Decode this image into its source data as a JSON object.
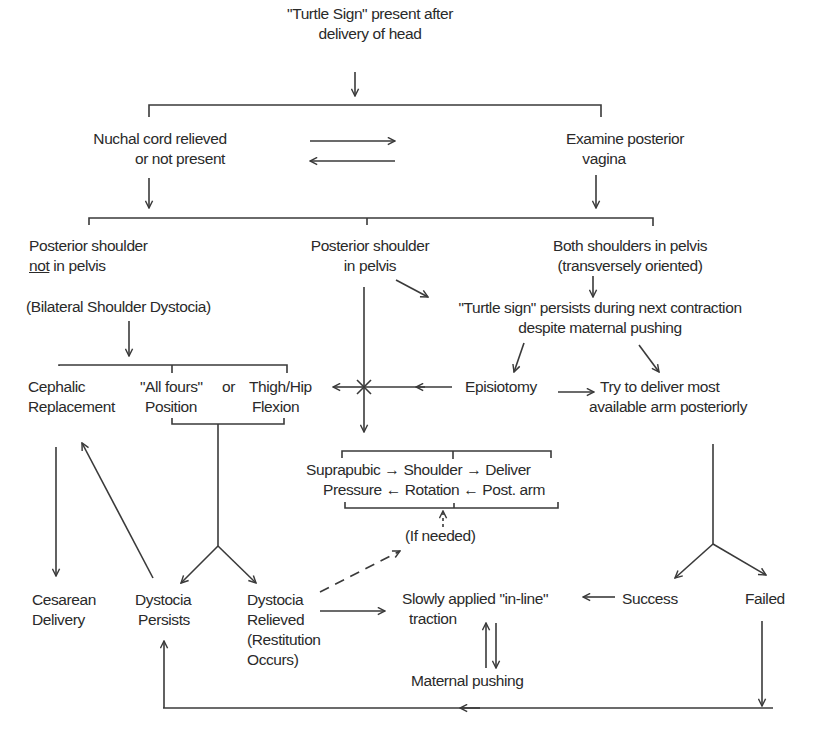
{
  "diagram": {
    "type": "flowchart",
    "nodes": {
      "start": {
        "lines": [
          "\"Turtle Sign\" present after",
          "delivery of head"
        ]
      },
      "nuchal": {
        "lines": [
          "Nuchal cord relieved",
          "or not present"
        ]
      },
      "examine": {
        "lines": [
          "Examine posterior",
          "vagina"
        ]
      },
      "post_not": {
        "line1": "Posterior shoulder",
        "line2_underlined": "not",
        "line2_rest": " in pelvis"
      },
      "post_in": {
        "lines": [
          "Posterior shoulder",
          "in pelvis"
        ]
      },
      "both": {
        "lines": [
          "Both shoulders in pelvis",
          "(transversely oriented)"
        ]
      },
      "bilateral": {
        "lines": [
          "(Bilateral Shoulder Dystocia)"
        ]
      },
      "turtle_persists": {
        "lines": [
          "\"Turtle sign\" persists during next contraction",
          "despite maternal pushing"
        ]
      },
      "cephalic": {
        "lines": [
          "Cephalic",
          "Replacement"
        ]
      },
      "allfours": {
        "lines": [
          "\"All fours\"",
          "Position"
        ]
      },
      "or": {
        "lines": [
          "or"
        ]
      },
      "thigh": {
        "lines": [
          "Thigh/Hip",
          "Flexion"
        ]
      },
      "episiotomy": {
        "lines": [
          "Episiotomy"
        ]
      },
      "try_deliver": {
        "lines": [
          "Try to deliver most",
          "available arm posteriorly"
        ]
      },
      "suprapubic": {
        "lines": [
          "Suprapubic",
          "Pressure"
        ]
      },
      "shoulder_rot": {
        "lines": [
          "Shoulder",
          "Rotation"
        ]
      },
      "deliver_post": {
        "lines": [
          "Deliver",
          "Post. arm"
        ]
      },
      "if_needed": {
        "lines": [
          "(If needed)"
        ]
      },
      "cesarean": {
        "lines": [
          "Cesarean",
          "Delivery"
        ]
      },
      "persists": {
        "lines": [
          "Dystocia",
          "Persists"
        ]
      },
      "relieved": {
        "lines": [
          "Dystocia",
          "Relieved",
          "(Restitution",
          "Occurs)"
        ]
      },
      "traction": {
        "lines": [
          "Slowly applied \"in-line\"",
          "traction"
        ]
      },
      "success": {
        "lines": [
          "Success"
        ]
      },
      "failed": {
        "lines": [
          "Failed"
        ]
      },
      "maternal": {
        "lines": [
          "Maternal pushing"
        ]
      }
    },
    "inline_arrows": {
      "right": "→",
      "left": "←"
    },
    "edges": [
      {
        "from": "start",
        "to": [
          "nuchal",
          "examine"
        ]
      },
      {
        "from": "nuchal",
        "to": "examine",
        "bidirectional": true
      },
      {
        "from": "nuchal",
        "to": [
          "post_not",
          "post_in",
          "both"
        ]
      },
      {
        "from": "examine",
        "to": [
          "post_not",
          "post_in",
          "both"
        ]
      },
      {
        "from": "post_not",
        "to": "bilateral"
      },
      {
        "from": "bilateral",
        "to": [
          "cephalic",
          "allfours",
          "thigh"
        ]
      },
      {
        "from": "post_in",
        "to": "turtle_persists"
      },
      {
        "from": "both",
        "to": "turtle_persists"
      },
      {
        "from": "turtle_persists",
        "to": [
          "episiotomy",
          "try_deliver"
        ]
      },
      {
        "from": "episiotomy",
        "to": "try_deliver"
      },
      {
        "from": "episiotomy",
        "to": "thigh"
      },
      {
        "from": "post_in",
        "to": "suprapubic"
      },
      {
        "from": "suprapubic",
        "to": "shoulder_rot"
      },
      {
        "from": "shoulder_rot",
        "to": "deliver_post"
      },
      {
        "from": "deliver_post",
        "to": "shoulder_rot"
      },
      {
        "from": "shoulder_rot",
        "to": "suprapubic"
      },
      {
        "from": "if_needed",
        "to": "suprapubic",
        "style": "dashed"
      },
      {
        "from": "relieved",
        "to": "if_needed",
        "style": "dashed"
      },
      {
        "from": "cephalic",
        "to": "cesarean"
      },
      {
        "from": "allfours",
        "to": [
          "persists",
          "relieved"
        ]
      },
      {
        "from": "persists",
        "to": "cephalic"
      },
      {
        "from": "relieved",
        "to": "traction"
      },
      {
        "from": "try_deliver",
        "to": [
          "success",
          "failed"
        ]
      },
      {
        "from": "success",
        "to": "traction"
      },
      {
        "from": "traction",
        "to": "maternal",
        "bidirectional": true
      },
      {
        "from": "failed",
        "to": "persists"
      }
    ]
  }
}
